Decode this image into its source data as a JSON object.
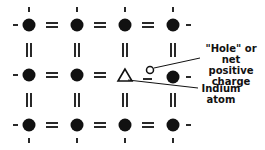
{
  "diagram": {
    "labels": {
      "hole_line1": "\"Hole\" or",
      "hole_line2": "net positive",
      "hole_line3": "charge",
      "indium_line1": "Indium",
      "indium_line2": "atom"
    },
    "lattice": {
      "columns": 4,
      "rows": 3
    },
    "colors": {
      "ink": "#111111",
      "background": "#ffffff"
    }
  }
}
